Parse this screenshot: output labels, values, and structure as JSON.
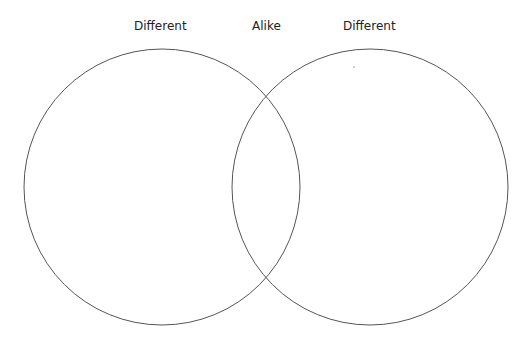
{
  "diagram": {
    "type": "venn",
    "labels": {
      "left": "Different",
      "middle": "Alike",
      "right": "Different"
    },
    "circles": [
      {
        "name": "left-circle",
        "cx": 162,
        "cy": 187,
        "r": 138
      },
      {
        "name": "right-circle",
        "cx": 370,
        "cy": 187,
        "r": 138
      }
    ],
    "stroke_color": "#555555",
    "background": "#ffffff"
  }
}
